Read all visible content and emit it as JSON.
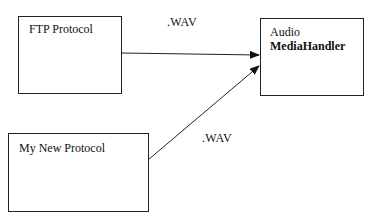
{
  "diagram": {
    "nodes": [
      {
        "id": "ftp",
        "label": "FTP Protocol"
      },
      {
        "id": "new",
        "label": "My New Protocol"
      },
      {
        "id": "audio",
        "line1": "Audio",
        "line2": "MediaHandler"
      }
    ],
    "edges": [
      {
        "from": "ftp",
        "to": "audio",
        "label": ".WAV"
      },
      {
        "from": "new",
        "to": "audio",
        "label": ".WAV"
      }
    ],
    "colors": {
      "stroke": "#222222",
      "background": "#ffffff"
    }
  }
}
